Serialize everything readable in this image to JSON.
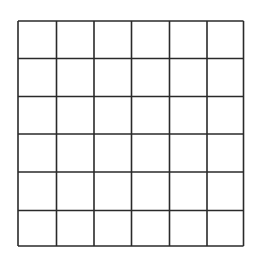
{
  "diagram": {
    "type": "grid",
    "rows": 6,
    "cols": 6,
    "x_lines": [
      18,
      56.5,
      94,
      131.5,
      169.5,
      207,
      243.5
    ],
    "y_lines": [
      21,
      58.5,
      96.5,
      134,
      172,
      210.5,
      246
    ],
    "stroke_color": "#2a2a2a",
    "stroke_width": 1.6,
    "background": "#ffffff"
  }
}
